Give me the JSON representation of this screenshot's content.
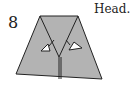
{
  "diagram": {
    "step_number": "8",
    "caption": "Head.",
    "colors": {
      "paper": "#b3b3b3",
      "line": "#222222",
      "arrow_fill": "#ffffff"
    }
  }
}
